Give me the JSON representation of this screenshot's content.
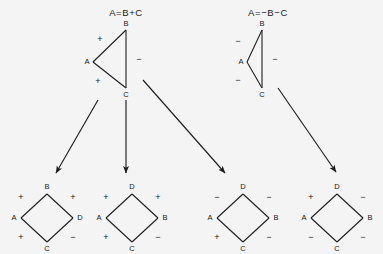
{
  "canvas": {
    "width": 383,
    "height": 254,
    "background": "#f4f4f4",
    "ink": "#1f1f1f"
  },
  "top_graphs": [
    {
      "id": "triangle-left",
      "equation": "A=B+C",
      "equation_pos": {
        "x": 126,
        "y": 13
      },
      "nodes": [
        {
          "name": "B",
          "x": 126,
          "y": 30,
          "label_dx": 0,
          "label_dy": -6
        },
        {
          "name": "A",
          "x": 93,
          "y": 62,
          "label_dx": -6,
          "label_dy": 0
        },
        {
          "name": "C",
          "x": 126,
          "y": 88,
          "label_dx": 0,
          "label_dy": 7
        }
      ],
      "edges": [
        {
          "from": "A",
          "to": "B",
          "sign": "+",
          "sign_x": 100,
          "sign_y": 40
        },
        {
          "from": "B",
          "to": "C",
          "sign": "−",
          "sign_x": 139,
          "sign_y": 60
        },
        {
          "from": "A",
          "to": "C",
          "sign": "+",
          "sign_x": 98,
          "sign_y": 82
        }
      ]
    },
    {
      "id": "triangle-right",
      "equation": "A=−B−C",
      "equation_pos": {
        "x": 268,
        "y": 13
      },
      "nodes": [
        {
          "name": "B",
          "x": 262,
          "y": 30,
          "label_dx": 0,
          "label_dy": -6
        },
        {
          "name": "A",
          "x": 247,
          "y": 62,
          "label_dx": -6,
          "label_dy": 0
        },
        {
          "name": "C",
          "x": 262,
          "y": 88,
          "label_dx": 0,
          "label_dy": 7
        }
      ],
      "edges": [
        {
          "from": "A",
          "to": "B",
          "sign": "−",
          "sign_x": 238,
          "sign_y": 42
        },
        {
          "from": "B",
          "to": "C",
          "sign": "−",
          "sign_x": 275,
          "sign_y": 60
        },
        {
          "from": "A",
          "to": "C",
          "sign": "−",
          "sign_x": 238,
          "sign_y": 81
        }
      ]
    }
  ],
  "arrows": [
    {
      "id": "arrow-1",
      "x1": 98,
      "y1": 100,
      "x2": 56,
      "y2": 173,
      "source": "triangle-left",
      "target": "square-1"
    },
    {
      "id": "arrow-2",
      "x1": 126,
      "y1": 100,
      "x2": 126,
      "y2": 173,
      "source": "triangle-left",
      "target": "square-2"
    },
    {
      "id": "arrow-3",
      "x1": 143,
      "y1": 80,
      "x2": 225,
      "y2": 173,
      "source": "triangle-left",
      "target": "square-3"
    },
    {
      "id": "arrow-4",
      "x1": 278,
      "y1": 88,
      "x2": 336,
      "y2": 172,
      "source": "triangle-right",
      "target": "square-4"
    }
  ],
  "bottom_graphs": [
    {
      "id": "square-1",
      "cx": 47,
      "cy": 218,
      "rx": 26,
      "ry": 24,
      "nodes": [
        {
          "name": "B",
          "pos": "top",
          "label_dx": 0,
          "label_dy": -7
        },
        {
          "name": "A",
          "pos": "left",
          "label_dx": -7,
          "label_dy": 0
        },
        {
          "name": "D",
          "pos": "right",
          "label_dx": 7,
          "label_dy": 0
        },
        {
          "name": "C",
          "pos": "bottom",
          "label_dx": 0,
          "label_dy": 7
        }
      ],
      "edges": [
        {
          "from": "A",
          "to": "B",
          "sign": "+",
          "sign_x": 21,
          "sign_y": 198
        },
        {
          "from": "B",
          "to": "D",
          "sign": "+",
          "sign_x": 73,
          "sign_y": 198
        },
        {
          "from": "A",
          "to": "C",
          "sign": "+",
          "sign_x": 21,
          "sign_y": 238
        },
        {
          "from": "C",
          "to": "D",
          "sign": "−",
          "sign_x": 73,
          "sign_y": 238
        }
      ]
    },
    {
      "id": "square-2",
      "cx": 132,
      "cy": 218,
      "rx": 26,
      "ry": 24,
      "nodes": [
        {
          "name": "D",
          "pos": "top",
          "label_dx": 0,
          "label_dy": -7
        },
        {
          "name": "A",
          "pos": "left",
          "label_dx": -7,
          "label_dy": 0
        },
        {
          "name": "B",
          "pos": "right",
          "label_dx": 7,
          "label_dy": 0
        },
        {
          "name": "C",
          "pos": "bottom",
          "label_dx": 0,
          "label_dy": 7
        }
      ],
      "edges": [
        {
          "from": "A",
          "to": "D",
          "sign": "+",
          "sign_x": 106,
          "sign_y": 198
        },
        {
          "from": "D",
          "to": "B",
          "sign": "+",
          "sign_x": 158,
          "sign_y": 198
        },
        {
          "from": "A",
          "to": "C",
          "sign": "+",
          "sign_x": 106,
          "sign_y": 238
        },
        {
          "from": "C",
          "to": "B",
          "sign": "−",
          "sign_x": 158,
          "sign_y": 238
        }
      ]
    },
    {
      "id": "square-3",
      "cx": 243,
      "cy": 218,
      "rx": 26,
      "ry": 24,
      "nodes": [
        {
          "name": "D",
          "pos": "top",
          "label_dx": 0,
          "label_dy": -7
        },
        {
          "name": "A",
          "pos": "left",
          "label_dx": -7,
          "label_dy": 0
        },
        {
          "name": "B",
          "pos": "right",
          "label_dx": 7,
          "label_dy": 0
        },
        {
          "name": "C",
          "pos": "bottom",
          "label_dx": 0,
          "label_dy": 7
        }
      ],
      "edges": [
        {
          "from": "A",
          "to": "D",
          "sign": "−",
          "sign_x": 217,
          "sign_y": 198
        },
        {
          "from": "D",
          "to": "B",
          "sign": "−",
          "sign_x": 269,
          "sign_y": 198
        },
        {
          "from": "A",
          "to": "C",
          "sign": "+",
          "sign_x": 217,
          "sign_y": 238
        },
        {
          "from": "C",
          "to": "B",
          "sign": "−",
          "sign_x": 269,
          "sign_y": 238
        }
      ]
    },
    {
      "id": "square-4",
      "cx": 337,
      "cy": 218,
      "rx": 26,
      "ry": 24,
      "nodes": [
        {
          "name": "D",
          "pos": "top",
          "label_dx": 0,
          "label_dy": -7
        },
        {
          "name": "A",
          "pos": "left",
          "label_dx": -7,
          "label_dy": 0
        },
        {
          "name": "B",
          "pos": "right",
          "label_dx": 7,
          "label_dy": 0
        },
        {
          "name": "C",
          "pos": "bottom",
          "label_dx": 0,
          "label_dy": 7
        }
      ],
      "edges": [
        {
          "from": "A",
          "to": "D",
          "sign": "+",
          "sign_x": 311,
          "sign_y": 198
        },
        {
          "from": "D",
          "to": "B",
          "sign": "−",
          "sign_x": 363,
          "sign_y": 198
        },
        {
          "from": "A",
          "to": "C",
          "sign": "−",
          "sign_x": 311,
          "sign_y": 238
        },
        {
          "from": "C",
          "to": "B",
          "sign": "−",
          "sign_x": 363,
          "sign_y": 238
        }
      ]
    }
  ]
}
